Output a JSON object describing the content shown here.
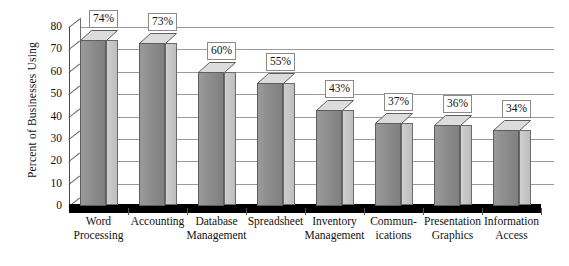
{
  "chart_data": {
    "type": "bar",
    "title": "",
    "xlabel": "",
    "ylabel": "Percent of Businesses Using",
    "ylim": [
      0,
      80
    ],
    "yticks": [
      0,
      10,
      20,
      30,
      40,
      50,
      60,
      70,
      80
    ],
    "grid": true,
    "legend": "none",
    "style": "3d-column",
    "value_label_suffix": "%",
    "categories": [
      "Word Processing",
      "Accounting",
      "Database Management",
      "Spreadsheet",
      "Inventory Management",
      "Communications",
      "Presentation Graphics",
      "Information Access"
    ],
    "category_lines": [
      [
        "Word",
        "Processing"
      ],
      [
        "Accounting",
        ""
      ],
      [
        "Database",
        "Management"
      ],
      [
        "Spreadsheet",
        ""
      ],
      [
        "Inventory",
        "Management"
      ],
      [
        "Commun-",
        "ications"
      ],
      [
        "Presentation",
        "Graphics"
      ],
      [
        "Information",
        "Access"
      ]
    ],
    "values": [
      74,
      73,
      60,
      55,
      43,
      37,
      36,
      34
    ],
    "value_labels": [
      "74%",
      "73%",
      "60%",
      "55%",
      "43%",
      "37%",
      "36%",
      "34%"
    ]
  },
  "colors": {
    "bar_front": "#8f8f8f",
    "bar_side": "#bdbdbd",
    "bar_top": "#dcdcdc",
    "bar_outline": "#5d5d5d",
    "gridline": "#9a9a9a",
    "axis": "#4a4a4a",
    "floor": "#000000",
    "background": "#ffffff",
    "label_box_border": "#8a8a8a",
    "text": "#111111"
  },
  "ytick_labels": [
    "0",
    "10",
    "20",
    "30",
    "40",
    "50",
    "60",
    "70",
    "80"
  ]
}
